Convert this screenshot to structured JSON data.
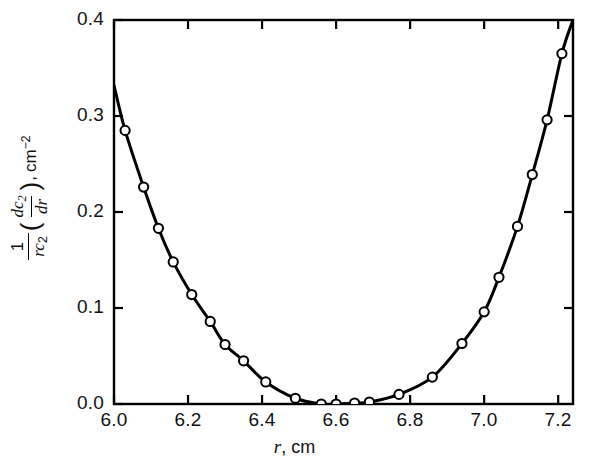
{
  "chart_data": {
    "type": "scatter",
    "title": "",
    "xlabel": "r, cm",
    "ylabel": "1/(rc2)(dc2/dr), cm^-2",
    "xlim": [
      6.0,
      7.24
    ],
    "ylim": [
      0.0,
      0.4
    ],
    "xticks": [
      6.0,
      6.2,
      6.4,
      6.6,
      6.8,
      7.0,
      7.2
    ],
    "xtick_labels": [
      "6.0",
      "6.2",
      "6.4",
      "6.6",
      "6.8",
      "7.0",
      "7.2"
    ],
    "yticks": [
      0.0,
      0.1,
      0.2,
      0.3,
      0.4
    ],
    "ytick_labels": [
      "0.0",
      "0.1",
      "0.2",
      "0.3",
      "0.4"
    ],
    "grid": false,
    "legend": null,
    "marker": "open-circle",
    "line": "solid-black",
    "x": [
      6.03,
      6.08,
      6.12,
      6.16,
      6.21,
      6.26,
      6.3,
      6.35,
      6.41,
      6.49,
      6.56,
      6.6,
      6.65,
      6.69,
      6.77,
      6.86,
      6.94,
      7.0,
      7.04,
      7.09,
      7.13,
      7.17,
      7.21
    ],
    "y": [
      0.285,
      0.226,
      0.183,
      0.148,
      0.114,
      0.086,
      0.062,
      0.045,
      0.023,
      0.006,
      0.0,
      0.0,
      0.001,
      0.002,
      0.01,
      0.028,
      0.063,
      0.096,
      0.132,
      0.185,
      0.239,
      0.296,
      0.365
    ],
    "curve_endpoints": {
      "left": [
        6.0,
        0.332
      ],
      "right": [
        7.24,
        0.4
      ]
    },
    "series_name": "1/(rc2) dc2/dr vs r"
  },
  "axis": {
    "ylabel_parts": {
      "one": "1",
      "rc2_r": "r",
      "rc2_c": "c",
      "rc2_sub": "2",
      "dc2_d": "d",
      "dc2_c": "c",
      "dc2_sub": "2",
      "dr_d": "d",
      "dr_r": "r",
      "comma": ",",
      "unit_cm": "cm",
      "unit_exp": "−2",
      "open_paren": "(",
      "close_paren": ")"
    },
    "xlabel_var": "r",
    "xlabel_rest": ", cm"
  },
  "colors": {
    "ink": "#000000",
    "background": "#ffffff",
    "marker_fill": "#ffffff"
  }
}
